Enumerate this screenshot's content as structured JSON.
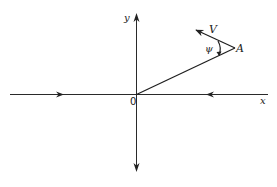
{
  "diagram": {
    "type": "vector-geometry",
    "axes": {
      "x_label": "x",
      "y_label": "y",
      "origin_label": "0"
    },
    "point": {
      "label": "A"
    },
    "velocity": {
      "label": "V"
    },
    "angle": {
      "label": "ψ"
    },
    "colors": {
      "stroke": "#2a2a2a",
      "background": "#ffffff"
    }
  }
}
